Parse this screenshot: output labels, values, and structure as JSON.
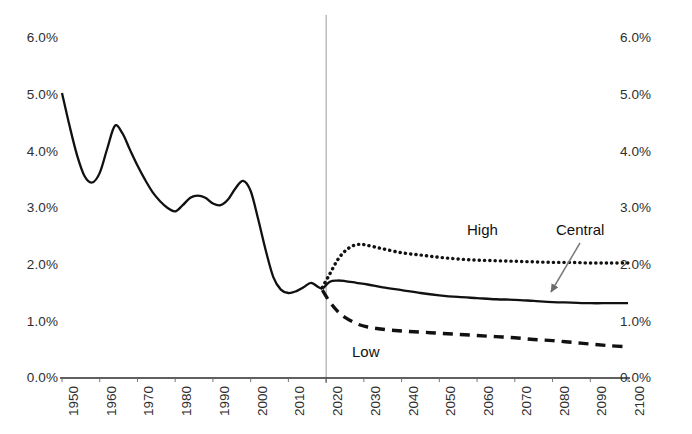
{
  "chart_data": {
    "type": "line",
    "title": "",
    "subtitle": "",
    "xlabel": "",
    "ylabel": "",
    "xlim": [
      1950,
      2100
    ],
    "ylim": [
      0.0,
      6.0
    ],
    "y_tick_format": "percent",
    "grid": false,
    "legend_position": "inline-annotations",
    "y_ticks": [
      "0.0%",
      "1.0%",
      "2.0%",
      "3.0%",
      "4.0%",
      "5.0%",
      "6.0%"
    ],
    "y_tick_values": [
      0.0,
      1.0,
      2.0,
      3.0,
      4.0,
      5.0,
      6.0
    ],
    "y_axis_left": [
      "6.0%",
      "5.0%",
      "4.0%",
      "3.0%",
      "2.0%",
      "1.0%",
      "0.0%"
    ],
    "y_axis_right": [
      "6.0%",
      "5.0%",
      "4.0%",
      "3.0%",
      "2.0%",
      "1.0%",
      "0.0%"
    ],
    "x_ticks": [
      "1950",
      "1960",
      "1970",
      "1980",
      "1990",
      "2000",
      "2010",
      "2020",
      "2030",
      "2040",
      "2050",
      "2060",
      "2070",
      "2080",
      "2090",
      "2100"
    ],
    "x_tick_values": [
      1950,
      1960,
      1970,
      1980,
      1990,
      2000,
      2010,
      2020,
      2030,
      2040,
      2050,
      2060,
      2070,
      2080,
      2090,
      2100
    ],
    "annotations": [
      {
        "text": "High",
        "x": 2033,
        "y": 2.75,
        "target_series": "High"
      },
      {
        "text": "Central",
        "x": 2058,
        "y": 2.78,
        "target_series": "Central",
        "has_arrow": true
      },
      {
        "text": "Low",
        "x": 2032,
        "y": 0.62,
        "target_series": "Low"
      }
    ],
    "divider_line": {
      "x": 2020,
      "label": "",
      "color": "#9a9a9a"
    },
    "series": [
      {
        "name": "Historical",
        "style": "solid",
        "color": "#111111",
        "x": [
          1950,
          1952,
          1954,
          1956,
          1958,
          1960,
          1962,
          1964,
          1966,
          1968,
          1970,
          1972,
          1974,
          1976,
          1978,
          1980,
          1982,
          1984,
          1986,
          1988,
          1990,
          1992,
          1994,
          1996,
          1998,
          2000,
          2002,
          2004,
          2006,
          2008,
          2010,
          2012,
          2014,
          2016,
          2018,
          2019
        ],
        "values": [
          5.03,
          4.45,
          3.93,
          3.56,
          3.45,
          3.62,
          4.05,
          4.45,
          4.32,
          4.03,
          3.75,
          3.5,
          3.28,
          3.12,
          3.0,
          2.94,
          3.05,
          3.18,
          3.22,
          3.18,
          3.08,
          3.05,
          3.15,
          3.35,
          3.48,
          3.3,
          2.8,
          2.25,
          1.78,
          1.56,
          1.5,
          1.53,
          1.6,
          1.68,
          1.6,
          1.57
        ]
      },
      {
        "name": "High",
        "style": "dotted",
        "color": "#111111",
        "x": [
          2019,
          2021,
          2023,
          2025,
          2027,
          2029,
          2031,
          2035,
          2040,
          2045,
          2050,
          2055,
          2060,
          2065,
          2070,
          2075,
          2080,
          2085,
          2090,
          2095,
          2100
        ],
        "values": [
          1.6,
          1.84,
          2.08,
          2.24,
          2.33,
          2.36,
          2.34,
          2.28,
          2.21,
          2.17,
          2.13,
          2.1,
          2.08,
          2.07,
          2.06,
          2.05,
          2.04,
          2.04,
          2.03,
          2.03,
          2.03
        ]
      },
      {
        "name": "Central",
        "style": "solid",
        "color": "#111111",
        "x": [
          2019,
          2021,
          2023,
          2025,
          2028,
          2031,
          2035,
          2040,
          2045,
          2050,
          2055,
          2060,
          2065,
          2070,
          2075,
          2080,
          2085,
          2090,
          2095,
          2100
        ],
        "values": [
          1.57,
          1.7,
          1.72,
          1.71,
          1.68,
          1.65,
          1.6,
          1.55,
          1.5,
          1.46,
          1.43,
          1.41,
          1.39,
          1.38,
          1.36,
          1.34,
          1.33,
          1.32,
          1.32,
          1.32
        ]
      },
      {
        "name": "Low",
        "style": "dashed",
        "color": "#111111",
        "x": [
          2019,
          2021,
          2023,
          2025,
          2028,
          2031,
          2035,
          2040,
          2045,
          2050,
          2055,
          2060,
          2065,
          2070,
          2075,
          2080,
          2085,
          2090,
          2095,
          2100
        ],
        "values": [
          1.55,
          1.34,
          1.18,
          1.07,
          0.96,
          0.9,
          0.86,
          0.83,
          0.81,
          0.79,
          0.77,
          0.75,
          0.73,
          0.71,
          0.68,
          0.66,
          0.63,
          0.6,
          0.57,
          0.55
        ]
      }
    ]
  }
}
